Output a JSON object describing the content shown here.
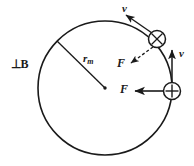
{
  "figure": {
    "background_color": "#ffffff",
    "stroke_color": "#1a1a1a",
    "labels": {
      "field_direction": "⊥B",
      "radius_symbol": "r",
      "radius_subscript": "m",
      "velocity_top": "v",
      "velocity_right": "v",
      "force_upper": "F",
      "force_lower": "F"
    },
    "orbit": {
      "center_x": 105,
      "center_y": 88,
      "radius": 67,
      "stroke_width": 1.6
    },
    "radius_line": {
      "from_x": 57,
      "from_y": 41,
      "to_x": 105,
      "to_y": 88
    },
    "charges": [
      {
        "name": "charge-into-page",
        "symbol": "⊗",
        "x": 157,
        "y": 39,
        "r": 8.5,
        "meaning": "current into page"
      },
      {
        "name": "charge-positive",
        "symbol": "⊕",
        "x": 172,
        "y": 91,
        "r": 8.5,
        "meaning": "positive charge"
      }
    ],
    "vectors": [
      {
        "name": "velocity-top",
        "label": "v",
        "style": "solid",
        "from_x": 152,
        "from_y": 33,
        "to_x": 125,
        "to_y": 14
      },
      {
        "name": "force-upper",
        "label": "F",
        "style": "dashed",
        "from_x": 152,
        "from_y": 46,
        "to_x": 130,
        "to_y": 63
      },
      {
        "name": "velocity-right",
        "label": "v",
        "style": "solid",
        "from_x": 172,
        "from_y": 82,
        "to_x": 172,
        "to_y": 48
      },
      {
        "name": "force-lower",
        "label": "F",
        "style": "solid",
        "from_x": 164,
        "from_y": 91,
        "to_x": 133,
        "to_y": 91
      }
    ]
  }
}
